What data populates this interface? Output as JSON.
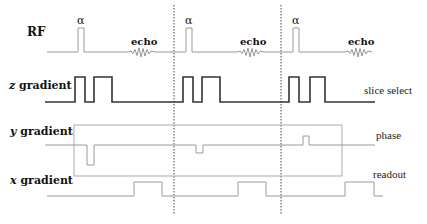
{
  "diagram": {
    "type": "pulse-sequence",
    "rows": [
      {
        "id": "rf",
        "label": "RF",
        "label_prefix": "",
        "right_label": ""
      },
      {
        "id": "z",
        "label": " gradient",
        "label_prefix": "z",
        "right_label": "slice select"
      },
      {
        "id": "y",
        "label": " gradient",
        "label_prefix": "y",
        "right_label": "phase"
      },
      {
        "id": "x",
        "label": " gradient",
        "label_prefix": "x",
        "right_label": "readout"
      }
    ],
    "rf": {
      "pulse_label": "α",
      "echo_label": "echo",
      "pulses": [
        {
          "alpha": "α",
          "echo": "echo"
        },
        {
          "alpha": "α",
          "echo": "echo"
        },
        {
          "alpha": "α",
          "echo": "echo"
        }
      ]
    },
    "separators": 2,
    "colors": {
      "rf_line": "#9a9a9a",
      "z_line": "#333333",
      "y_line": "#9a9a9a",
      "x_line": "#9a9a9a",
      "separator": "#444444",
      "text": "#111111"
    }
  }
}
